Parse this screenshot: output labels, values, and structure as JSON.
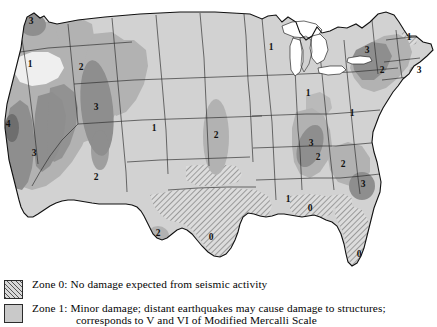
{
  "map": {
    "name": "us-seismic-zone-map",
    "zone_labels": [
      {
        "id": "wa-puget-3",
        "text": "3",
        "x": 31,
        "y": 24,
        "zone": 3,
        "region": "Puget Sound, Washington"
      },
      {
        "id": "me-1",
        "text": "1",
        "x": 409,
        "y": 40,
        "zone": 1,
        "region": "Maine"
      },
      {
        "id": "ny-3",
        "text": "3",
        "x": 367,
        "y": 53,
        "zone": 3,
        "region": "Northern New York"
      },
      {
        "id": "or-1",
        "text": "1",
        "x": 30,
        "y": 67,
        "zone": 1,
        "region": "Eastern Oregon"
      },
      {
        "id": "id-2",
        "text": "2",
        "x": 81,
        "y": 70,
        "zone": 2,
        "region": "Idaho"
      },
      {
        "id": "ny-2",
        "text": "2",
        "x": 382,
        "y": 73,
        "zone": 2,
        "region": "New York"
      },
      {
        "id": "ne-3",
        "text": "3",
        "x": 419,
        "y": 73,
        "zone": 3,
        "region": "Massachusetts / Cape Ann"
      },
      {
        "id": "mt-3",
        "text": "3",
        "x": 96,
        "y": 110,
        "zone": 3,
        "region": "Western Montana"
      },
      {
        "id": "gl-1",
        "text": "1",
        "x": 271,
        "y": 50,
        "zone": 1,
        "region": "Upper Midwest"
      },
      {
        "id": "co-1",
        "text": "1",
        "x": 154,
        "y": 131,
        "zone": 1,
        "region": "Colorado"
      },
      {
        "id": "ks-2",
        "text": "2",
        "x": 216,
        "y": 138,
        "zone": 2,
        "region": "Kansas / Nebraska"
      },
      {
        "id": "oh-1",
        "text": "1",
        "x": 308,
        "y": 96,
        "zone": 1,
        "region": "Ohio"
      },
      {
        "id": "mid-atl-1",
        "text": "1",
        "x": 352,
        "y": 116,
        "zone": 1,
        "region": "Mid-Atlantic"
      },
      {
        "id": "nm-2",
        "text": "2",
        "x": 96,
        "y": 180,
        "zone": 2,
        "region": "New Mexico"
      },
      {
        "id": "ca-4",
        "text": "4",
        "x": 8,
        "y": 127,
        "zone": 4,
        "region": "San Francisco Bay Area, California"
      },
      {
        "id": "ca-3",
        "text": "3",
        "x": 34,
        "y": 156,
        "zone": 3,
        "region": "California"
      },
      {
        "id": "nm-3",
        "text": "3",
        "x": 311,
        "y": 146,
        "zone": 3,
        "region": "New Madrid, Missouri"
      },
      {
        "id": "tn-2",
        "text": "2",
        "x": 318,
        "y": 160,
        "zone": 2,
        "region": "Tennessee"
      },
      {
        "id": "va-2",
        "text": "2",
        "x": 343,
        "y": 167,
        "zone": 2,
        "region": "Virginia / Carolinas"
      },
      {
        "id": "sc-3",
        "text": "3",
        "x": 363,
        "y": 187,
        "zone": 3,
        "region": "Charleston, South Carolina"
      },
      {
        "id": "ms-1",
        "text": "1",
        "x": 288,
        "y": 202,
        "zone": 1,
        "region": "Mississippi / Alabama"
      },
      {
        "id": "la-0",
        "text": "0",
        "x": 310,
        "y": 211,
        "zone": 0,
        "region": "Gulf Coast"
      },
      {
        "id": "wtx-2",
        "text": "2",
        "x": 158,
        "y": 236,
        "zone": 2,
        "region": "West Texas"
      },
      {
        "id": "tx-0",
        "text": "0",
        "x": 211,
        "y": 240,
        "zone": 0,
        "region": "Texas"
      },
      {
        "id": "fl-0",
        "text": "0",
        "x": 359,
        "y": 257,
        "zone": 0,
        "region": "Florida"
      }
    ]
  },
  "legend": {
    "name": "seismic-zone-legend",
    "entries": [
      {
        "zone": "0",
        "swatch": "hatched",
        "line1": "Zone 0: No damage expected from seismic activity",
        "line2": ""
      },
      {
        "zone": "1",
        "swatch": "solid-light",
        "line1": "Zone 1: Minor damage; distant earthquakes may cause damage to structures;",
        "line2": "corresponds to V and VI of Modified Mercalli Scale"
      }
    ]
  },
  "colors": {
    "zone0_fill": "#d9d9d9",
    "zone1_fill": "#d2d2d2",
    "zone2_fill": "#b2b2b2",
    "zone3_fill": "#8e8e8e",
    "zone4_fill": "#6e6e6e",
    "outline": "#1a1a1a",
    "background": "#ffffff",
    "text": "#050505"
  }
}
